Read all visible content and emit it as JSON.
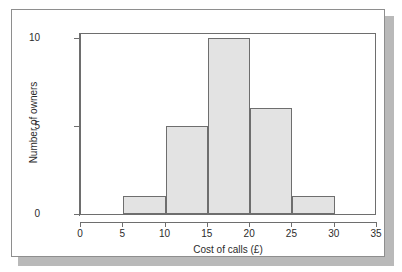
{
  "chart_data": {
    "type": "bar",
    "title": "",
    "xlabel": "Cost of calls (£)",
    "ylabel": "Number of owners",
    "xlim": [
      0,
      35
    ],
    "ylim": [
      0,
      10
    ],
    "grid": false,
    "legend": null,
    "xticks": [
      "0",
      "5",
      "10",
      "15",
      "20",
      "25",
      "30",
      "35"
    ],
    "xtick_values": [
      0,
      5,
      10,
      15,
      20,
      25,
      30,
      35
    ],
    "yticks": [
      "0",
      "5",
      "10"
    ],
    "ytick_values": [
      0,
      5,
      10
    ],
    "bin_width": 5,
    "categories": [
      "5-10",
      "10-15",
      "15-20",
      "20-25",
      "25-30"
    ],
    "bins": [
      {
        "start": 5,
        "end": 10,
        "value": 1
      },
      {
        "start": 10,
        "end": 15,
        "value": 5
      },
      {
        "start": 15,
        "end": 20,
        "value": 10
      },
      {
        "start": 20,
        "end": 25,
        "value": 6
      },
      {
        "start": 25,
        "end": 30,
        "value": 1
      }
    ],
    "values": [
      1,
      5,
      10,
      6,
      1
    ],
    "colors": {
      "bar_fill": "#e3e3e3",
      "bar_edge": "#6e6e6e",
      "axis": "#6e6e6e",
      "text": "#2b2b2b",
      "frame": "#8e8e8e",
      "shadow": "#b9b9b9",
      "background": "#ffffff"
    }
  }
}
